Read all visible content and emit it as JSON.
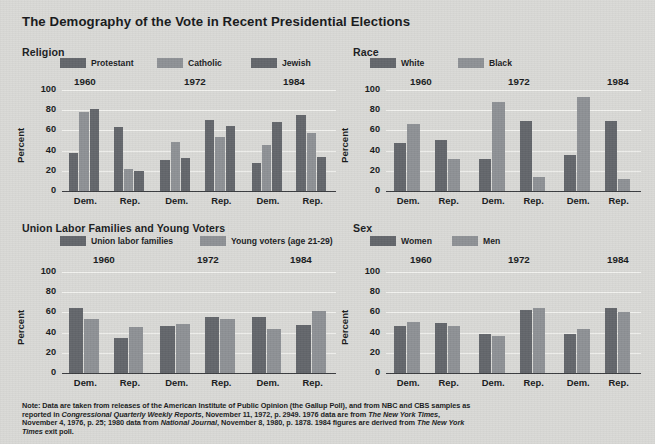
{
  "title": "The Demography of the Vote in Recent Presidential Elections",
  "background_color": "#d9d9d6",
  "palette": {
    "dark": "#63666b",
    "light": "#8e9195",
    "axis": "#3b3d40",
    "grid": "#f2f2ef",
    "text": "#17191b"
  },
  "axis": {
    "ylabel": "Percent",
    "yticks": [
      "100",
      "80",
      "60",
      "40",
      "20",
      "0"
    ],
    "ymin": 0,
    "ymax": 100,
    "party_labels": [
      "Dem.",
      "Rep."
    ]
  },
  "footnote": {
    "line1_a": "Note: Data are taken from releases of the American Institute of Public Opinion (the Gallup Poll), and from NBC and",
    "line2_a": "CBS samples as reported in ",
    "line2_i": "Congressional Quarterly Weekly Reports",
    "line2_b": ", November 11, 1972, p. 2949. 1976 data are",
    "line3_a": "from ",
    "line3_i": "The New York Times",
    "line3_b": ", November 4, 1976, p. 25; 1980 data from ",
    "line3_i2": "National Journal",
    "line3_c": ", November 8, 1980, p. 1878.",
    "line4_a": "1984 figures are derived from ",
    "line4_i": "The New York Times",
    "line4_b": " exit poll."
  },
  "chart_data": [
    {
      "id": "religion",
      "type": "bar",
      "title": "Religion",
      "ylabel": "Percent",
      "ylim": [
        0,
        100
      ],
      "grid": true,
      "legend_position": "top",
      "legend": [
        "Protestant",
        "Catholic",
        "Jewish"
      ],
      "legend_colors": [
        "#63666b",
        "#8e9195",
        "#63666b"
      ],
      "groups": [
        "1960",
        "1972",
        "1984"
      ],
      "categories": [
        "Dem.",
        "Rep."
      ],
      "series": [
        {
          "name": "Protestant",
          "color": "#63666b",
          "values": {
            "1960": [
              38,
              63
            ],
            "1972": [
              31,
              70
            ],
            "1984": [
              28,
              75
            ]
          }
        },
        {
          "name": "Catholic",
          "color": "#8e9195",
          "values": {
            "1960": [
              78,
              22
            ],
            "1972": [
              49,
              53
            ],
            "1984": [
              46,
              57
            ]
          }
        },
        {
          "name": "Jewish",
          "color": "#63666b",
          "values": {
            "1960": [
              81,
              20
            ],
            "1972": [
              33,
              64
            ],
            "1984": [
              68,
              34
            ]
          }
        }
      ]
    },
    {
      "id": "race",
      "type": "bar",
      "title": "Race",
      "ylabel": "Percent",
      "ylim": [
        0,
        100
      ],
      "grid": true,
      "legend_position": "top",
      "legend": [
        "White",
        "Black"
      ],
      "legend_colors": [
        "#63666b",
        "#8e9195"
      ],
      "groups": [
        "1960",
        "1972",
        "1984"
      ],
      "categories": [
        "Dem.",
        "Rep."
      ],
      "series": [
        {
          "name": "White",
          "color": "#63666b",
          "values": {
            "1960": [
              48,
              51
            ],
            "1972": [
              32,
              69
            ],
            "1984": [
              36,
              69
            ]
          }
        },
        {
          "name": "Black",
          "color": "#8e9195",
          "values": {
            "1960": [
              66,
              32
            ],
            "1972": [
              88,
              14
            ],
            "1984": [
              93,
              12
            ]
          }
        }
      ]
    },
    {
      "id": "union-young",
      "type": "bar",
      "title": "Union Labor Families and Young Voters",
      "ylabel": "Percent",
      "ylim": [
        0,
        100
      ],
      "grid": true,
      "legend_position": "top",
      "legend": [
        "Union labor families",
        "Young voters (age 21-29)"
      ],
      "legend_colors": [
        "#63666b",
        "#8e9195"
      ],
      "groups": [
        "1960",
        "1972",
        "1984"
      ],
      "categories": [
        "Dem.",
        "Rep."
      ],
      "series": [
        {
          "name": "Union labor families",
          "color": "#63666b",
          "values": {
            "1960": [
              64,
              35
            ],
            "1972": [
              47,
              55
            ],
            "1984": [
              55,
              48
            ]
          }
        },
        {
          "name": "Young voters (age 21-29)",
          "color": "#8e9195",
          "values": {
            "1960": [
              53,
              46
            ],
            "1972": [
              49,
              53
            ],
            "1984": [
              44,
              61
            ]
          }
        }
      ]
    },
    {
      "id": "sex",
      "type": "bar",
      "title": "Sex",
      "ylabel": "Percent",
      "ylim": [
        0,
        100
      ],
      "grid": true,
      "legend_position": "top",
      "legend": [
        "Women",
        "Men"
      ],
      "legend_colors": [
        "#63666b",
        "#8e9195"
      ],
      "groups": [
        "1960",
        "1972",
        "1984"
      ],
      "categories": [
        "Dem.",
        "Rep."
      ],
      "series": [
        {
          "name": "Women",
          "color": "#63666b",
          "values": {
            "1960": [
              47,
              50
            ],
            "1972": [
              39,
              62
            ],
            "1984": [
              39,
              64
            ]
          }
        },
        {
          "name": "Men",
          "color": "#8e9195",
          "values": {
            "1960": [
              51,
              47
            ],
            "1972": [
              37,
              64
            ],
            "1984": [
              44,
              60
            ]
          }
        }
      ]
    }
  ]
}
